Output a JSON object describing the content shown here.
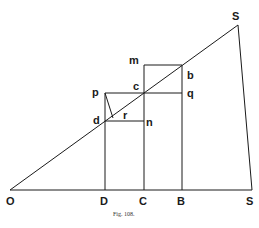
{
  "diagram": {
    "caption": "Fig. 108.",
    "labels": {
      "O": "O",
      "D": "D",
      "C": "C",
      "B": "B",
      "S_base": "S",
      "S": "S",
      "m": "m",
      "b": "b",
      "p": "p",
      "c": "c",
      "q": "q",
      "d": "d",
      "r": "r",
      "n": "n"
    },
    "colors": {
      "line": "#1a1a1a",
      "background": "#ffffff"
    },
    "points": {
      "O": [
        10,
        190
      ],
      "D": [
        105,
        190
      ],
      "C": [
        144,
        190
      ],
      "B": [
        182,
        190
      ],
      "base_right": [
        252,
        190
      ],
      "S": [
        238,
        25
      ],
      "m": [
        144,
        65
      ],
      "b": [
        182,
        65
      ],
      "p": [
        105,
        93
      ],
      "c": [
        144,
        93
      ],
      "q": [
        182,
        93
      ],
      "d": [
        105,
        121
      ],
      "n": [
        144,
        121
      ],
      "r": [
        112,
        117
      ]
    }
  }
}
